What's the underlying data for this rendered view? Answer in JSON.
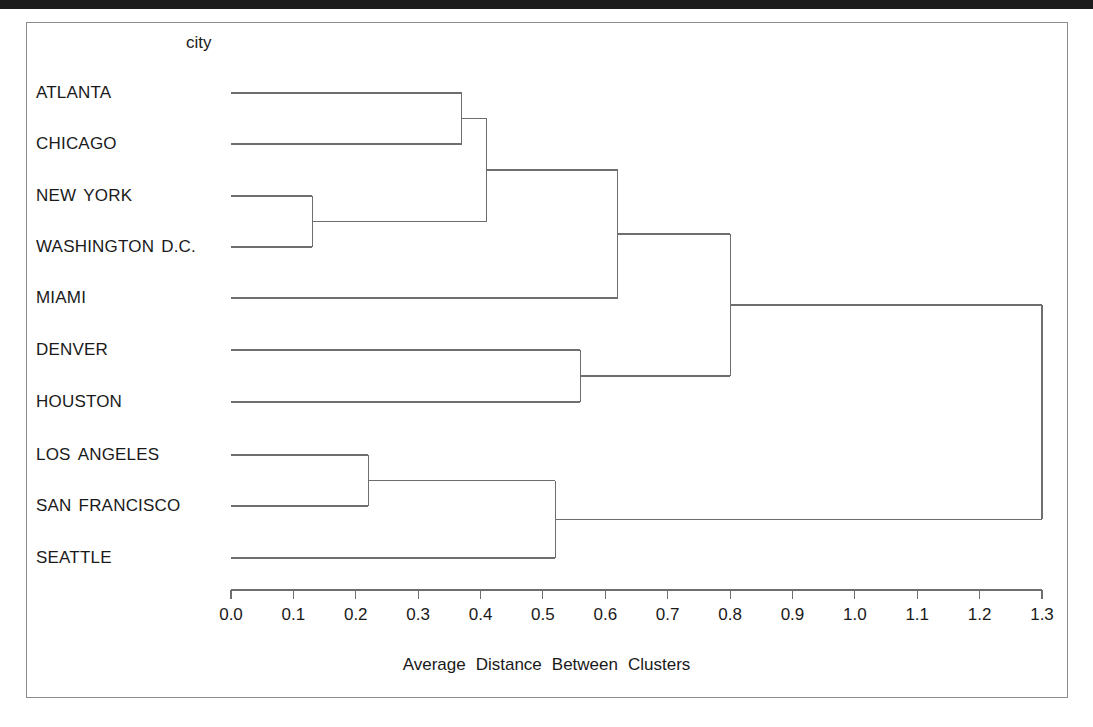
{
  "figure": {
    "group_header": "city",
    "axis_title": "Average Distance Between Clusters"
  },
  "chart_data": {
    "type": "dendrogram",
    "title": "",
    "subtitle": "",
    "xlabel": "Average Distance Between Clusters",
    "ylabel": "city",
    "xlim": [
      0.0,
      1.3
    ],
    "grid": false,
    "legend": "none",
    "orientation": "horizontal-left-to-right",
    "tick_labels": [
      "0.0",
      "0.1",
      "0.2",
      "0.3",
      "0.4",
      "0.5",
      "0.6",
      "0.7",
      "0.8",
      "0.9",
      "1.0",
      "1.1",
      "1.2",
      "1.3"
    ],
    "tick_values": [
      0.0,
      0.1,
      0.2,
      0.3,
      0.4,
      0.5,
      0.6,
      0.7,
      0.8,
      0.9,
      1.0,
      1.1,
      1.2,
      1.3
    ],
    "leaves": [
      {
        "label": "ATLANTA",
        "y": 93
      },
      {
        "label": "CHICAGO",
        "y": 144
      },
      {
        "label": "NEW  YORK",
        "y": 196
      },
      {
        "label": "WASHINGTON  D.C.",
        "y": 247
      },
      {
        "label": "MIAMI",
        "y": 298
      },
      {
        "label": "DENVER",
        "y": 350
      },
      {
        "label": "HOUSTON",
        "y": 402
      },
      {
        "label": "LOS  ANGELES",
        "y": 455
      },
      {
        "label": "SAN  FRANCISCO",
        "y": 506
      },
      {
        "label": "SEATTLE",
        "y": 558
      }
    ],
    "merges": [
      {
        "name": "new-york+washington",
        "distance": 0.13,
        "members": [
          "NEW  YORK",
          "WASHINGTON  D.C."
        ]
      },
      {
        "name": "los-angeles+san-francisco",
        "distance": 0.22,
        "members": [
          "LOS  ANGELES",
          "SAN  FRANCISCO"
        ]
      },
      {
        "name": "atlanta+chicago",
        "distance": 0.37,
        "members": [
          "ATLANTA",
          "CHICAGO"
        ]
      },
      {
        "name": "northeast-midwest",
        "distance": 0.41,
        "members": [
          "ATLANTA",
          "CHICAGO",
          "NEW  YORK",
          "WASHINGTON  D.C."
        ]
      },
      {
        "name": "west-coast",
        "distance": 0.52,
        "members": [
          "LOS  ANGELES",
          "SAN  FRANCISCO",
          "SEATTLE"
        ]
      },
      {
        "name": "denver+houston",
        "distance": 0.56,
        "members": [
          "DENVER",
          "HOUSTON"
        ]
      },
      {
        "name": "east",
        "distance": 0.62,
        "members": [
          "ATLANTA",
          "CHICAGO",
          "NEW  YORK",
          "WASHINGTON  D.C.",
          "MIAMI"
        ]
      },
      {
        "name": "east+central",
        "distance": 0.8,
        "members": [
          "ATLANTA",
          "CHICAGO",
          "NEW  YORK",
          "WASHINGTON  D.C.",
          "MIAMI",
          "DENVER",
          "HOUSTON"
        ]
      },
      {
        "name": "root",
        "distance": 1.3,
        "members": [
          "ALL"
        ]
      }
    ]
  },
  "colors": {
    "line": "#6e6e6e",
    "frame": "#8c8c8c",
    "text": "#1a1a1a",
    "background": "#ffffff",
    "scan_band": "#1c1c1c"
  }
}
